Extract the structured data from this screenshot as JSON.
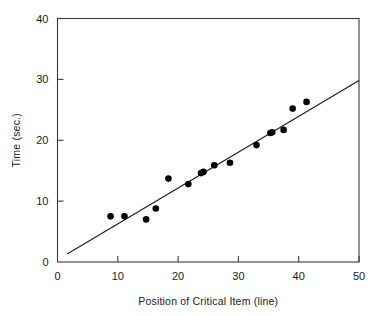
{
  "chart_data": {
    "type": "scatter",
    "title": "",
    "xlabel": "Position of Critical Item (line)",
    "ylabel": "Time (sec.)",
    "xlim": [
      0,
      50
    ],
    "ylim": [
      0,
      40
    ],
    "xticks": [
      0,
      10,
      20,
      30,
      40,
      50
    ],
    "yticks": [
      0,
      10,
      20,
      30,
      40
    ],
    "xtick_labels": [
      "0",
      "10",
      "20",
      "30",
      "40",
      "50"
    ],
    "ytick_labels": [
      "0",
      "10",
      "20",
      "30",
      "40"
    ],
    "grid": false,
    "legend": false,
    "points": [
      {
        "x": 8.8,
        "y": 7.5
      },
      {
        "x": 11.1,
        "y": 7.5
      },
      {
        "x": 14.7,
        "y": 7.0
      },
      {
        "x": 16.3,
        "y": 8.8
      },
      {
        "x": 18.4,
        "y": 13.7
      },
      {
        "x": 21.7,
        "y": 12.8
      },
      {
        "x": 23.8,
        "y": 14.6
      },
      {
        "x": 24.2,
        "y": 14.8
      },
      {
        "x": 26.0,
        "y": 15.9
      },
      {
        "x": 28.6,
        "y": 16.3
      },
      {
        "x": 33.0,
        "y": 19.2
      },
      {
        "x": 35.3,
        "y": 21.2
      },
      {
        "x": 35.6,
        "y": 21.3
      },
      {
        "x": 37.5,
        "y": 21.7
      },
      {
        "x": 39.0,
        "y": 25.2
      },
      {
        "x": 41.3,
        "y": 26.3
      }
    ],
    "fit_line": {
      "x_start": 1.6,
      "y_start": 1.3,
      "x_end": 50.0,
      "y_end": 29.8,
      "description": "least-squares regression line"
    }
  },
  "axes": {
    "x_axis_name": "Position of Critical Item (line)",
    "y_axis_name": "Time (sec.)"
  }
}
